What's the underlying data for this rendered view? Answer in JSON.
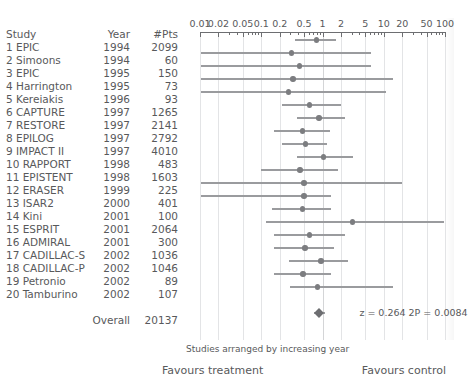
{
  "table": {
    "headers": {
      "study": "Study",
      "year": "Year",
      "pts": "#Pts"
    },
    "rows": [
      {
        "n": "1",
        "study": "1 EPIC",
        "year": "1994",
        "pts": "2099"
      },
      {
        "n": "2",
        "study": "2 Simoons",
        "year": "1994",
        "pts": "60"
      },
      {
        "n": "3",
        "study": "3 EPIC",
        "year": "1995",
        "pts": "150"
      },
      {
        "n": "4",
        "study": "4 Harrington",
        "year": "1995",
        "pts": "73"
      },
      {
        "n": "5",
        "study": "5 Kereiakis",
        "year": "1996",
        "pts": "93"
      },
      {
        "n": "6",
        "study": "6 CAPTURE",
        "year": "1997",
        "pts": "1265"
      },
      {
        "n": "7",
        "study": "7 RESTORE",
        "year": "1997",
        "pts": "2141"
      },
      {
        "n": "8",
        "study": "8 EPILOG",
        "year": "1997",
        "pts": "2792"
      },
      {
        "n": "9",
        "study": "9 IMPACT II",
        "year": "1997",
        "pts": "4010"
      },
      {
        "n": "10",
        "study": "10 RAPPORT",
        "year": "1998",
        "pts": "483"
      },
      {
        "n": "11",
        "study": "11 EPISTENT",
        "year": "1998",
        "pts": "1603"
      },
      {
        "n": "12",
        "study": "12 ERASER",
        "year": "1999",
        "pts": "225"
      },
      {
        "n": "13",
        "study": "13 ISAR2",
        "year": "2000",
        "pts": "401"
      },
      {
        "n": "14",
        "study": "14 Kini",
        "year": "2001",
        "pts": "100"
      },
      {
        "n": "15",
        "study": "15 ESPRIT",
        "year": "2001",
        "pts": "2064"
      },
      {
        "n": "16",
        "study": "16 ADMIRAL",
        "year": "2001",
        "pts": "300"
      },
      {
        "n": "17",
        "study": "17 CADILLAC-S",
        "year": "2002",
        "pts": "1036"
      },
      {
        "n": "18",
        "study": "18 CADILLAC-P",
        "year": "2002",
        "pts": "1046"
      },
      {
        "n": "19",
        "study": "19 Petronio",
        "year": "2002",
        "pts": "89"
      },
      {
        "n": "20",
        "study": "20 Tamburino",
        "year": "2002",
        "pts": "107"
      }
    ],
    "overall": {
      "study": "",
      "year": "Overall",
      "pts": "20137"
    }
  },
  "footer": {
    "subcaption": "Studies arranged by increasing year",
    "favours_treatment": "Favours treatment",
    "favours_control": "Favours control",
    "stats": "z = 0.264  2P = 0.0084"
  },
  "chart_data": {
    "type": "forest",
    "title": "",
    "xlabel": "",
    "ylabel": "",
    "xscale": "log",
    "xlim": [
      0.01,
      100
    ],
    "null_value": 1,
    "grid": true,
    "tick_labels": [
      "0.01",
      "0.02",
      "0.05",
      "0.1",
      "0.2",
      "0.5",
      "1",
      "2",
      "5",
      "10",
      "20",
      "50",
      "100"
    ],
    "tick_values": [
      0.01,
      0.02,
      0.05,
      0.1,
      0.2,
      0.5,
      1,
      2,
      5,
      10,
      20,
      50,
      100
    ],
    "categories": [
      "1 EPIC",
      "2 Simoons",
      "3 EPIC",
      "4 Harrington",
      "5 Kereiakis",
      "6 CAPTURE",
      "7 RESTORE",
      "8 EPILOG",
      "9 IMPACT II",
      "10 RAPPORT",
      "11 EPISTENT",
      "12 ERASER",
      "13 ISAR2",
      "14 Kini",
      "15 ESPRIT",
      "16 ADMIRAL",
      "17 CADILLAC-S",
      "18 CADILLAC-P",
      "19 Petronio",
      "20 Tamburino"
    ],
    "points": [
      {
        "study": "1 EPIC",
        "estimate": 0.8,
        "ci_low": 0.36,
        "ci_high": 1.65
      },
      {
        "study": "2 Simoons",
        "estimate": 0.31,
        "ci_low": 0.0105,
        "ci_high": 6.2
      },
      {
        "study": "3 EPIC",
        "estimate": 0.42,
        "ci_low": 0.0105,
        "ci_high": 6.2
      },
      {
        "study": "4 Harrington",
        "estimate": 0.33,
        "ci_low": 0.0105,
        "ci_high": 14.0
      },
      {
        "study": "5 Kereiakis",
        "estimate": 0.28,
        "ci_low": 0.0105,
        "ci_high": 11.0
      },
      {
        "study": "6 CAPTURE",
        "estimate": 0.62,
        "ci_low": 0.22,
        "ci_high": 2.0
      },
      {
        "study": "7 RESTORE",
        "estimate": 0.88,
        "ci_low": 0.38,
        "ci_high": 2.35
      },
      {
        "study": "8 EPILOG",
        "estimate": 0.47,
        "ci_low": 0.16,
        "ci_high": 1.35
      },
      {
        "study": "9 IMPACT II",
        "estimate": 0.53,
        "ci_low": 0.22,
        "ci_high": 1.2
      },
      {
        "study": "10 RAPPORT",
        "estimate": 1.05,
        "ci_low": 0.38,
        "ci_high": 3.1
      },
      {
        "study": "11 EPISTENT",
        "estimate": 0.43,
        "ci_low": 0.1,
        "ci_high": 1.8
      },
      {
        "study": "12 ERASER",
        "estimate": 0.5,
        "ci_low": 0.0105,
        "ci_high": 20.0
      },
      {
        "study": "13 ISAR2",
        "estimate": 0.5,
        "ci_low": 0.0105,
        "ci_high": 1.4
      },
      {
        "study": "14 Kini",
        "estimate": 0.47,
        "ci_low": 0.15,
        "ci_high": 1.4
      },
      {
        "study": "15 ESPRIT",
        "estimate": 3.1,
        "ci_low": 0.12,
        "ci_high": 95.0
      },
      {
        "study": "16 ADMIRAL",
        "estimate": 0.62,
        "ci_low": 0.16,
        "ci_high": 2.3
      },
      {
        "study": "17 CADILLAC-S",
        "estimate": 0.52,
        "ci_low": 0.16,
        "ci_high": 1.55
      },
      {
        "study": "18 CADILLAC-P",
        "estimate": 0.95,
        "ci_low": 0.28,
        "ci_high": 2.6
      },
      {
        "study": "19 Petronio",
        "estimate": 0.48,
        "ci_low": 0.16,
        "ci_high": 1.4
      },
      {
        "study": "20 Tamburino",
        "estimate": 0.82,
        "ci_low": 0.29,
        "ci_high": 14.0
      }
    ],
    "overall": {
      "label": "Overall",
      "n": "20137",
      "estimate": 0.88,
      "ci_low": 0.72,
      "ci_high": 1.08
    }
  }
}
